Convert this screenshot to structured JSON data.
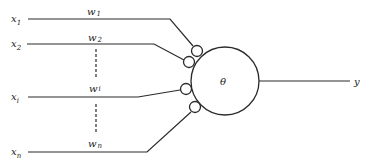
{
  "diagram": {
    "type": "perceptron / threshold neuron",
    "inputs": [
      {
        "var": "x",
        "sub": "1",
        "weight_var": "w",
        "weight_sub": "1"
      },
      {
        "var": "x",
        "sub": "2",
        "weight_var": "w",
        "weight_sub": "2"
      },
      {
        "var": "x",
        "sub": "i",
        "weight_var": "w",
        "weight_sub": "i"
      },
      {
        "var": "x",
        "sub": "n",
        "weight_var": "w",
        "weight_sub": "n"
      }
    ],
    "threshold_label": "θ",
    "output_label": "y",
    "colors": {
      "line": "#2a2a2a",
      "background": "#ffffff"
    }
  }
}
